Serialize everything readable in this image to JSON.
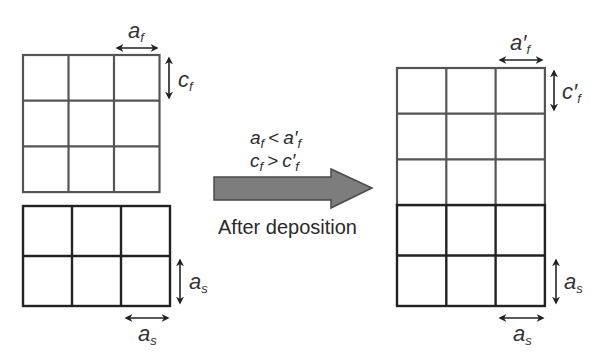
{
  "diagram": {
    "left": {
      "film": {
        "rows": 3,
        "cols": 3,
        "x": 23,
        "y": 55,
        "cell_w": 45.5,
        "cell_h": 45.7,
        "stroke": "#555555",
        "label_a": "a",
        "label_a_sub": "f",
        "label_c": "c",
        "label_c_sub": "f"
      },
      "substrate": {
        "rows": 2,
        "cols": 3,
        "x": 23,
        "y": 206,
        "cell_w": 49,
        "cell_h": 50,
        "stroke": "#222222",
        "label_vertical": "a",
        "label_vertical_sub": "s",
        "label_horizontal": "a",
        "label_horizontal_sub": "s"
      }
    },
    "arrow": {
      "color": "#7a7a7a",
      "stroke": "#444444",
      "relation_1": {
        "lhs": "a",
        "lhs_sub": "f",
        "op": "<",
        "rhs": "a′",
        "rhs_sub": "f"
      },
      "relation_2": {
        "lhs": "c",
        "lhs_sub": "f",
        "op": ">",
        "rhs": "c′",
        "rhs_sub": "f"
      },
      "caption": "After deposition"
    },
    "right": {
      "film": {
        "rows": 3,
        "cols": 3,
        "x": 397,
        "y": 68,
        "cell_w": 49.3,
        "cell_h": 45.7,
        "stroke": "#555555",
        "label_a": "a′",
        "label_a_sub": "f",
        "label_c": "c′",
        "label_c_sub": "f"
      },
      "substrate": {
        "rows": 2,
        "cols": 3,
        "x": 397,
        "y": 205,
        "cell_w": 49.3,
        "cell_h": 50.5,
        "stroke": "#222222",
        "label_vertical": "a",
        "label_vertical_sub": "s",
        "label_horizontal": "a",
        "label_horizontal_sub": "s"
      }
    }
  }
}
